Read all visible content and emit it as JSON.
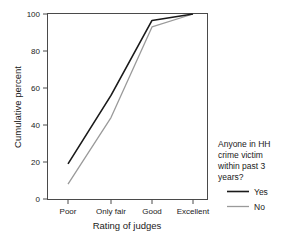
{
  "chart_data": {
    "type": "line",
    "title": "",
    "subtitle": "",
    "xlabel": "Rating of judges",
    "ylabel": "Cumulative percent",
    "categories": [
      "Poor",
      "Only fair",
      "Good",
      "Excellent"
    ],
    "ylim": [
      0,
      100
    ],
    "yticks": [
      "0",
      "20",
      "40",
      "60",
      "80",
      "100"
    ],
    "ytick_values": [
      0,
      20,
      40,
      60,
      80,
      100
    ],
    "grid": false,
    "legend_position": "right",
    "legend_title": "Anyone in HH crime victim within past 3 years?",
    "series": [
      {
        "name": "Yes",
        "values": [
          19,
          56,
          96.5,
          100
        ],
        "color": "#1a1a1a"
      },
      {
        "name": "No",
        "values": [
          8,
          44,
          93,
          100
        ],
        "color": "#9a9a9a"
      }
    ]
  },
  "legend": {
    "title_lines": [
      "Anyone in HH",
      "crime victim",
      "within past 3",
      "years?"
    ],
    "entries": [
      {
        "label": "Yes",
        "color": "#1a1a1a"
      },
      {
        "label": "No",
        "color": "#9a9a9a"
      }
    ]
  },
  "axes": {
    "y_title": "Cumulative percent",
    "x_title": "Rating of judges",
    "y_ticks": [
      "100",
      "80",
      "60",
      "40",
      "20",
      "0"
    ],
    "x_ticks": [
      "Poor",
      "Only fair",
      "Good",
      "Excellent"
    ]
  },
  "colors": {
    "frame": "#4a4a4a",
    "yes_line": "#1a1a1a",
    "no_line": "#9a9a9a",
    "text": "#1a1a1a",
    "background": "#ffffff"
  }
}
